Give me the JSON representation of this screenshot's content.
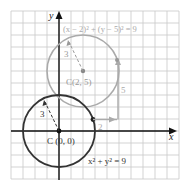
{
  "diagram": {
    "grid": {
      "x_min": -4,
      "x_max": 10,
      "y_min": -4,
      "y_max": 10,
      "unit_px": 12,
      "origin_px": [
        59,
        131
      ],
      "line_color": "#c8c8c8"
    },
    "axes": {
      "x_label": "x",
      "y_label": "y",
      "color": "#111111"
    },
    "circles": [
      {
        "name": "original",
        "center": [
          0,
          0
        ],
        "radius": 3,
        "color": "#333333",
        "equation": "x² + y² = 9",
        "center_label": "C (0, 0)",
        "radius_label": "3"
      },
      {
        "name": "translated",
        "center": [
          2,
          5
        ],
        "radius": 3,
        "color": "#aaaaaa",
        "equation": "(x − 2)² + (y − 5)² = 9",
        "center_label": "C(2, 5)",
        "radius_label": "3"
      }
    ],
    "translation": {
      "horizontal_label": "2",
      "vertical_label": "5",
      "color": "#aaaaaa"
    }
  }
}
